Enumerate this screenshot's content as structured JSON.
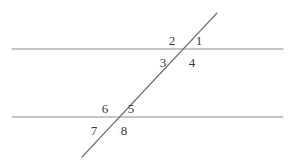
{
  "figure": {
    "width": 293,
    "height": 162,
    "background_color": "#ffffff",
    "line_color": "#8c8c8c",
    "transversal_color": "#6e6e6e",
    "label_color": "#3a3a3a"
  },
  "chart_data": {
    "type": "diagram",
    "title": "",
    "subtitle": "",
    "lines": [
      {
        "name": "upper-parallel-line",
        "role": "parallel",
        "x1": 12,
        "y1": 49,
        "x2": 283,
        "y2": 49
      },
      {
        "name": "lower-parallel-line",
        "role": "parallel",
        "x1": 12,
        "y1": 117,
        "x2": 283,
        "y2": 117
      },
      {
        "name": "transversal-line",
        "role": "transversal",
        "x1": 82,
        "y1": 157,
        "x2": 217,
        "y2": 13
      }
    ],
    "intersections": [
      {
        "name": "upper-intersection",
        "x": 185,
        "y": 49
      },
      {
        "name": "lower-intersection",
        "x": 117,
        "y": 117
      }
    ],
    "labels": [
      {
        "id": "angle-1",
        "text": "1",
        "x": 199,
        "y": 40,
        "position": "upper-right-above"
      },
      {
        "id": "angle-2",
        "text": "2",
        "x": 172,
        "y": 40,
        "position": "upper-left-above"
      },
      {
        "id": "angle-3",
        "text": "3",
        "x": 163,
        "y": 62,
        "position": "upper-left-below"
      },
      {
        "id": "angle-4",
        "text": "4",
        "x": 192,
        "y": 62,
        "position": "upper-right-below"
      },
      {
        "id": "angle-5",
        "text": "5",
        "x": 131,
        "y": 108,
        "position": "lower-right-above"
      },
      {
        "id": "angle-6",
        "text": "6",
        "x": 105,
        "y": 108,
        "position": "lower-left-above"
      },
      {
        "id": "angle-7",
        "text": "7",
        "x": 94,
        "y": 130,
        "position": "lower-left-below"
      },
      {
        "id": "angle-8",
        "text": "8",
        "x": 124,
        "y": 130,
        "position": "lower-right-below"
      }
    ]
  }
}
